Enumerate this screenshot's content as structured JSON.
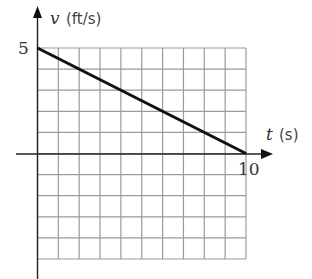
{
  "chart_data": {
    "type": "line",
    "title": "",
    "xlabel": "t (s)",
    "ylabel": "v (ft/s)",
    "x_var": "t",
    "x_unit": "(s)",
    "y_var": "v",
    "y_unit": "(ft/s)",
    "xlim": [
      0,
      10
    ],
    "ylim": [
      -5,
      5
    ],
    "x_tick_labels": [
      "10"
    ],
    "y_tick_labels": [
      "5"
    ],
    "grid": true,
    "grid_step_x": 1,
    "grid_step_y": 1,
    "series": [
      {
        "name": "v(t)",
        "x": [
          0,
          10
        ],
        "y": [
          5,
          0
        ]
      }
    ],
    "colors": {
      "line": "#111111",
      "grid": "#9a9a9a",
      "axis": "#222222"
    }
  }
}
